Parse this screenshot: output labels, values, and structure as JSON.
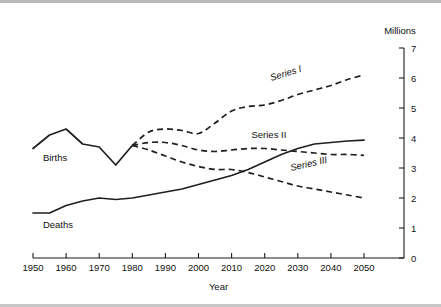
{
  "chart_data": {
    "type": "line",
    "title": "",
    "xlabel": "Year",
    "ylabel": "Millions",
    "unit_label": "Millions",
    "xlim": [
      1950,
      2050
    ],
    "ylim": [
      0,
      7
    ],
    "xticks": [
      1950,
      1960,
      1970,
      1980,
      1990,
      2000,
      2010,
      2020,
      2030,
      2040,
      2050
    ],
    "xtick_labels": [
      "1950",
      "1960",
      "1970",
      "1980",
      "1990",
      "2000",
      "2010",
      "2020",
      "2030",
      "2040",
      "2050"
    ],
    "yticks": [
      0,
      1,
      2,
      3,
      4,
      5,
      6,
      7
    ],
    "ytick_labels": [
      "0",
      "1",
      "2",
      "3",
      "4",
      "5",
      "6",
      "7"
    ],
    "grid": false,
    "legend_position": "inline-annotations",
    "y_axis_side": "right",
    "series": [
      {
        "name": "Births",
        "label": "Births",
        "style": "solid",
        "label_x": 1953,
        "label_y": 3.25,
        "label_rotation": 0,
        "x": [
          1950,
          1955,
          1960,
          1965,
          1970,
          1975,
          1980
        ],
        "values": [
          3.65,
          4.1,
          4.3,
          3.8,
          3.7,
          3.1,
          3.75
        ]
      },
      {
        "name": "Deaths",
        "label": "Deaths",
        "style": "solid",
        "label_x": 1953,
        "label_y": 1.0,
        "label_rotation": 0,
        "x": [
          1950,
          1955,
          1960,
          1965,
          1970,
          1975,
          1980,
          1985,
          1990,
          1995,
          2000,
          2005,
          2010,
          2015,
          2020,
          2025,
          2030,
          2035,
          2040,
          2045,
          2050
        ],
        "values": [
          1.5,
          1.5,
          1.75,
          1.9,
          2.0,
          1.95,
          2.0,
          2.1,
          2.2,
          2.3,
          2.45,
          2.6,
          2.75,
          2.95,
          3.2,
          3.45,
          3.65,
          3.8,
          3.85,
          3.9,
          3.93
        ]
      },
      {
        "name": "Series I",
        "label": "Series I",
        "style": "dashed",
        "label_x": 2022,
        "label_y": 5.9,
        "label_rotation": -17,
        "x": [
          1980,
          1985,
          1990,
          1995,
          2000,
          2005,
          2010,
          2015,
          2020,
          2025,
          2030,
          2035,
          2040,
          2045,
          2050
        ],
        "values": [
          3.75,
          4.2,
          4.3,
          4.25,
          4.15,
          4.5,
          4.9,
          5.05,
          5.1,
          5.25,
          5.45,
          5.6,
          5.75,
          5.95,
          6.1
        ]
      },
      {
        "name": "Series II",
        "label": "Series II",
        "style": "dashed",
        "label_x": 2016,
        "label_y": 4.0,
        "label_rotation": 0,
        "x": [
          1980,
          1985,
          1990,
          1995,
          2000,
          2005,
          2010,
          2015,
          2020,
          2025,
          2030,
          2035,
          2040,
          2045,
          2050
        ],
        "values": [
          3.75,
          3.85,
          3.85,
          3.75,
          3.6,
          3.55,
          3.6,
          3.65,
          3.65,
          3.6,
          3.55,
          3.5,
          3.45,
          3.45,
          3.42
        ]
      },
      {
        "name": "Series III",
        "label": "Series III",
        "style": "dashed",
        "label_x": 2028,
        "label_y": 2.9,
        "label_rotation": -13,
        "x": [
          1980,
          1985,
          1990,
          1995,
          2000,
          2005,
          2010,
          2015,
          2020,
          2025,
          2030,
          2035,
          2040,
          2045,
          2050
        ],
        "values": [
          3.75,
          3.6,
          3.4,
          3.2,
          3.05,
          2.95,
          2.95,
          2.85,
          2.7,
          2.55,
          2.4,
          2.3,
          2.2,
          2.1,
          2.0
        ]
      }
    ]
  },
  "plot_geometry": {
    "left": 33,
    "right": 404,
    "top": 48,
    "bottom": 258
  }
}
